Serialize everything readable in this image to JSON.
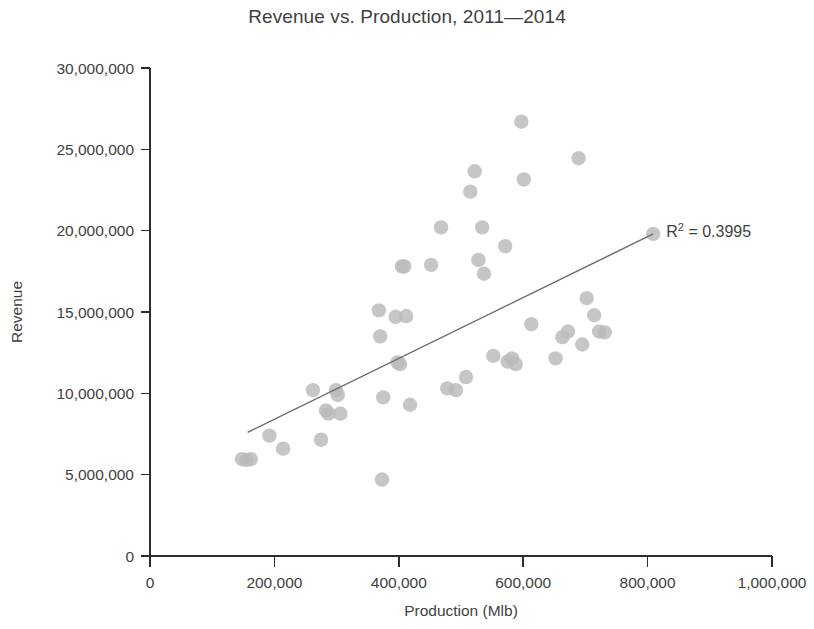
{
  "chart_data": {
    "type": "scatter",
    "title": "Revenue vs. Production, 2011—2014",
    "xlabel": "Production (Mlb)",
    "ylabel": "Revenue",
    "xlim": [
      0,
      1000000
    ],
    "ylim": [
      0,
      30000000
    ],
    "grid": false,
    "legend": null,
    "x_ticks": [
      0,
      200000,
      400000,
      600000,
      800000,
      1000000
    ],
    "x_tick_labels": [
      "0",
      "200,000",
      "400,000",
      "600,000",
      "800,000",
      "1,000,000"
    ],
    "y_ticks": [
      0,
      5000000,
      10000000,
      15000000,
      20000000,
      25000000,
      30000000
    ],
    "y_tick_labels": [
      "0",
      "5,000,000",
      "10,000,000",
      "15,000,000",
      "20,000,000",
      "25,000,000",
      "30,000,000"
    ],
    "annotations": [
      {
        "name": "r-squared",
        "text": "R² = 0.3995",
        "x": 830000,
        "y": 19600000
      }
    ],
    "trendline": {
      "type": "linear",
      "x_start": 157000,
      "y_start": 7600000,
      "x_end": 809000,
      "y_end": 19800000,
      "r_squared": 0.3995
    },
    "points": [
      {
        "x": 148000,
        "y": 5950000
      },
      {
        "x": 155000,
        "y": 5900000
      },
      {
        "x": 162000,
        "y": 5950000
      },
      {
        "x": 192000,
        "y": 7400000
      },
      {
        "x": 214000,
        "y": 6600000
      },
      {
        "x": 262000,
        "y": 10200000
      },
      {
        "x": 275000,
        "y": 7150000
      },
      {
        "x": 283000,
        "y": 8950000
      },
      {
        "x": 287000,
        "y": 8750000
      },
      {
        "x": 299000,
        "y": 10200000
      },
      {
        "x": 302000,
        "y": 9900000
      },
      {
        "x": 306000,
        "y": 8750000
      },
      {
        "x": 368000,
        "y": 15100000
      },
      {
        "x": 370000,
        "y": 13500000
      },
      {
        "x": 373000,
        "y": 4700000
      },
      {
        "x": 375000,
        "y": 9750000
      },
      {
        "x": 395000,
        "y": 14700000
      },
      {
        "x": 398000,
        "y": 11900000
      },
      {
        "x": 402000,
        "y": 11800000
      },
      {
        "x": 405000,
        "y": 17800000
      },
      {
        "x": 409000,
        "y": 17800000
      },
      {
        "x": 412000,
        "y": 14750000
      },
      {
        "x": 418000,
        "y": 9300000
      },
      {
        "x": 452000,
        "y": 17900000
      },
      {
        "x": 468000,
        "y": 20200000
      },
      {
        "x": 478000,
        "y": 10300000
      },
      {
        "x": 492000,
        "y": 10200000
      },
      {
        "x": 508000,
        "y": 11000000
      },
      {
        "x": 515000,
        "y": 22400000
      },
      {
        "x": 522000,
        "y": 23650000
      },
      {
        "x": 528000,
        "y": 18200000
      },
      {
        "x": 534000,
        "y": 20200000
      },
      {
        "x": 537000,
        "y": 17350000
      },
      {
        "x": 552000,
        "y": 12300000
      },
      {
        "x": 571000,
        "y": 19050000
      },
      {
        "x": 575000,
        "y": 11950000
      },
      {
        "x": 582000,
        "y": 12150000
      },
      {
        "x": 588000,
        "y": 11800000
      },
      {
        "x": 597000,
        "y": 26700000
      },
      {
        "x": 601000,
        "y": 23150000
      },
      {
        "x": 613000,
        "y": 14250000
      },
      {
        "x": 652000,
        "y": 12150000
      },
      {
        "x": 663000,
        "y": 13450000
      },
      {
        "x": 672000,
        "y": 13800000
      },
      {
        "x": 689000,
        "y": 24450000
      },
      {
        "x": 695000,
        "y": 13000000
      },
      {
        "x": 702000,
        "y": 15850000
      },
      {
        "x": 714000,
        "y": 14800000
      },
      {
        "x": 722000,
        "y": 13800000
      },
      {
        "x": 731000,
        "y": 13750000
      },
      {
        "x": 809000,
        "y": 19800000
      }
    ]
  }
}
